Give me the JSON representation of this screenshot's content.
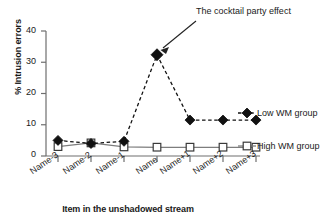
{
  "chart_data": {
    "type": "line",
    "title": "",
    "xlabel": "Item in the unshadowed stream",
    "ylabel": "% Intrusion errors",
    "categories": [
      "Name-3",
      "Name-2",
      "Name-1",
      "Name",
      "Name+1",
      "Name+2",
      "Name+3"
    ],
    "ylim": [
      0,
      40
    ],
    "yticks": [
      0,
      10,
      20,
      30,
      40
    ],
    "grid": false,
    "legend_position": "right",
    "series": [
      {
        "name": "Low WM group",
        "marker": "filled-diamond",
        "line_style": "dashed",
        "color": "#000000",
        "values": [
          5.0,
          4.0,
          4.7,
          32.4,
          11.5,
          11.5,
          11.5
        ]
      },
      {
        "name": "High WM group",
        "marker": "open-square",
        "line_style": "solid",
        "color": "#7a7a7a",
        "values": [
          3.0,
          4.2,
          2.9,
          2.8,
          2.8,
          2.8,
          2.8
        ]
      }
    ],
    "annotations": [
      {
        "text": "The cocktail party effect",
        "points_to_category": "Name",
        "points_to_series": "Low WM group"
      }
    ]
  },
  "ytick_labels": [
    "40",
    "30",
    "20",
    "10",
    "0"
  ],
  "legend": {
    "low": "Low WM group",
    "high": "High WM group"
  },
  "annotation_text": "The cocktail party effect"
}
